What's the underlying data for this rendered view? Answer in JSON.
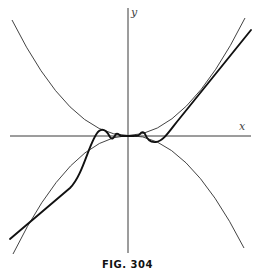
{
  "figure": {
    "caption": "FIG. 304",
    "axes": {
      "x_label": "x",
      "y_label": "y"
    },
    "curves": [
      {
        "name": "upper-parabola",
        "description": "y = x^2 (bounding curve above)"
      },
      {
        "name": "lower-parabola",
        "description": "y = -x^2 (bounding curve below)"
      },
      {
        "name": "oscillating-curve",
        "description": "thick curve oscillating between the parabolas near origin, approaching a straight line far from origin"
      }
    ]
  }
}
